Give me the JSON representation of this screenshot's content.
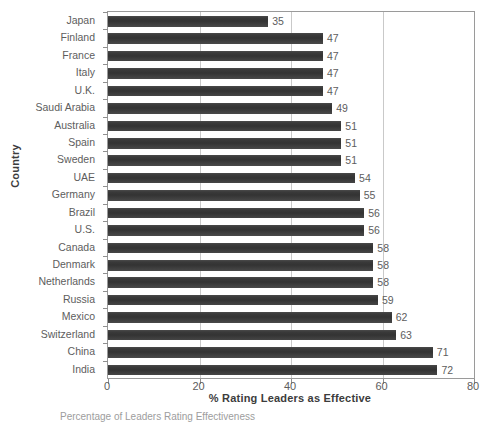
{
  "chart_data": {
    "type": "bar",
    "orientation": "horizontal",
    "title": "",
    "xlabel": "% Rating Leaders as Effective",
    "ylabel": "Country",
    "xlim": [
      0,
      80
    ],
    "xticks": [
      0,
      20,
      40,
      60,
      80
    ],
    "grid": true,
    "legend": "none",
    "bar_color": "#3b3b3b",
    "label_color": "#5d5d5d",
    "axis_color": "#9a9a9a",
    "gridline_color": "#c9c9c9",
    "categories": [
      "Japan",
      "Finland",
      "France",
      "Italy",
      "U.K.",
      "Saudi Arabia",
      "Australia",
      "Spain",
      "Sweden",
      "UAE",
      "Germany",
      "Brazil",
      "U.S.",
      "Canada",
      "Denmark",
      "Netherlands",
      "Russia",
      "Mexico",
      "Switzerland",
      "China",
      "India"
    ],
    "values": [
      35,
      47,
      47,
      47,
      47,
      49,
      51,
      51,
      51,
      54,
      55,
      56,
      56,
      58,
      58,
      58,
      59,
      62,
      63,
      71,
      72
    ],
    "data_labels": [
      "35",
      "47",
      "47",
      "47",
      "47",
      "49",
      "51",
      "51",
      "51",
      "54",
      "55",
      "56",
      "56",
      "58",
      "58",
      "58",
      "59",
      "62",
      "63",
      "71",
      "72"
    ]
  },
  "axis": {
    "x_tick_labels": [
      "0",
      "20",
      "40",
      "60",
      "80"
    ],
    "x_title": "% Rating Leaders as Effective",
    "y_title": "Country"
  },
  "caption": {
    "text": "Percentage of Leaders Rating Effectiveness"
  }
}
